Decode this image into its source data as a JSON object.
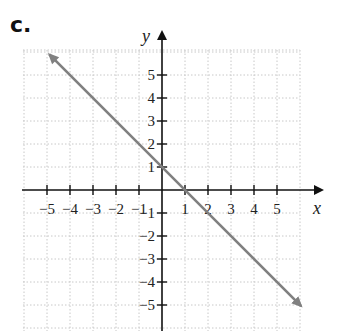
{
  "panel_label": "c.",
  "chart_data": {
    "type": "line",
    "title": "",
    "xlabel": "x",
    "ylabel": "y",
    "xlim": [
      -6,
      6
    ],
    "ylim": [
      -6,
      6.5
    ],
    "x_ticks": [
      -5,
      -4,
      -3,
      -2,
      -1,
      1,
      2,
      3,
      4,
      5
    ],
    "y_ticks": [
      -5,
      -4,
      -3,
      -2,
      -1,
      1,
      2,
      3,
      4,
      5
    ],
    "x_tick_labels": [
      "−5",
      "−4",
      "−3",
      "−2",
      "−1",
      "1",
      "2",
      "3",
      "4",
      "5"
    ],
    "y_tick_labels": [
      "−5",
      "−4",
      "−3",
      "−2",
      "−1",
      "1",
      "2",
      "3",
      "4",
      "5"
    ],
    "grid": true,
    "grid_style": "dotted",
    "series": [
      {
        "name": "y = -x + 1",
        "equation": "y = -x + 1",
        "slope": -1,
        "y_intercept": 1,
        "x_intercept": 1,
        "x": [
          -5,
          -4,
          -3,
          -2,
          -1,
          0,
          1,
          2,
          3,
          4,
          5,
          6
        ],
        "y": [
          6,
          5,
          4,
          3,
          2,
          1,
          0,
          -1,
          -2,
          -3,
          -4,
          -5
        ],
        "arrows_both_ends": true,
        "color": "#808080"
      }
    ],
    "axis_color": "#111111",
    "grid_color": "#c8c8c8"
  }
}
